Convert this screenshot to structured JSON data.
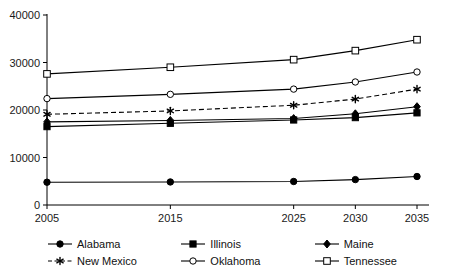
{
  "chart_data": {
    "type": "line",
    "title": "",
    "subtitle": "",
    "xlabel": "",
    "ylabel": "",
    "x": [
      2005,
      2015,
      2025,
      2030,
      2035
    ],
    "categories": [
      "2005",
      "2015",
      "2025",
      "2030",
      "2035"
    ],
    "xlim": [
      2005,
      2035
    ],
    "ylim": [
      0,
      40000
    ],
    "y_ticks": [
      0,
      10000,
      20000,
      30000,
      40000
    ],
    "y_tick_labels": [
      "0",
      "10000",
      "20000",
      "30000",
      "40000"
    ],
    "x_ticks": [
      2005,
      2015,
      2025,
      2030,
      2035
    ],
    "x_tick_labels": [
      "2005",
      "2015",
      "2025",
      "2030",
      "2035"
    ],
    "grid": false,
    "legend_position": "bottom",
    "series": [
      {
        "name": "Alabama",
        "marker": "filled-circle",
        "linestyle": "solid",
        "color": "#000000",
        "values": [
          4800,
          4850,
          4950,
          5350,
          6000
        ]
      },
      {
        "name": "Illinois",
        "marker": "filled-square",
        "linestyle": "solid",
        "color": "#000000",
        "values": [
          16500,
          17200,
          17900,
          18400,
          19400
        ]
      },
      {
        "name": "Maine",
        "marker": "filled-diamond",
        "linestyle": "solid",
        "color": "#000000",
        "values": [
          17500,
          17800,
          18200,
          19200,
          20700
        ]
      },
      {
        "name": "New Mexico",
        "marker": "asterisk",
        "linestyle": "dashed",
        "color": "#000000",
        "values": [
          19100,
          19800,
          21000,
          22300,
          24400
        ]
      },
      {
        "name": "Oklahoma",
        "marker": "open-circle",
        "linestyle": "solid",
        "color": "#000000",
        "values": [
          22400,
          23300,
          24400,
          25900,
          28000
        ]
      },
      {
        "name": "Tennessee",
        "marker": "open-square",
        "linestyle": "solid",
        "color": "#000000",
        "values": [
          27600,
          29000,
          30600,
          32500,
          34800
        ]
      }
    ]
  },
  "legend": {
    "entries": [
      {
        "label": "Alabama",
        "marker": "filled-circle",
        "linestyle": "solid"
      },
      {
        "label": "Illinois",
        "marker": "filled-square",
        "linestyle": "solid"
      },
      {
        "label": "Maine",
        "marker": "filled-diamond",
        "linestyle": "solid"
      },
      {
        "label": "New Mexico",
        "marker": "asterisk",
        "linestyle": "dashed"
      },
      {
        "label": "Oklahoma",
        "marker": "open-circle",
        "linestyle": "solid"
      },
      {
        "label": "Tennessee",
        "marker": "open-square",
        "linestyle": "solid"
      }
    ]
  },
  "caption": {
    "text": ""
  }
}
